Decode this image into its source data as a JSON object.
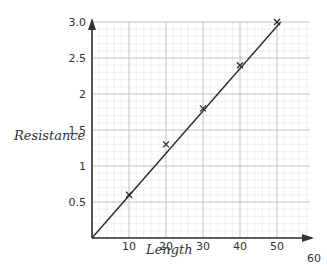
{
  "chart_data": {
    "type": "line",
    "title": "",
    "xlabel": "Length",
    "ylabel": "Resistance",
    "xlim": [
      0,
      60
    ],
    "ylim": [
      0,
      3.0
    ],
    "x_ticks": [
      10,
      20,
      30,
      40,
      50,
      60
    ],
    "x_tick_labels": [
      "10",
      "20",
      "30",
      "40",
      "50",
      "60"
    ],
    "y_ticks": [
      0.5,
      1,
      1.5,
      2,
      2.5,
      3.0
    ],
    "y_tick_labels": [
      "0.5",
      "1",
      "1.5",
      "2",
      "2.5",
      "3.0"
    ],
    "grid": true,
    "series": [
      {
        "name": "Measured points",
        "marker": "x",
        "x": [
          10,
          20,
          30,
          40,
          50
        ],
        "y": [
          0.6,
          1.3,
          1.8,
          2.4,
          3.0
        ]
      },
      {
        "name": "Line of best fit",
        "style": "line",
        "x": [
          0,
          51
        ],
        "y": [
          0,
          3.0
        ]
      }
    ]
  },
  "colors": {
    "grid_minor": "#e6e6e6",
    "grid_major": "#c8c8c8",
    "axis": "#333333",
    "line": "#2a2a2a"
  }
}
